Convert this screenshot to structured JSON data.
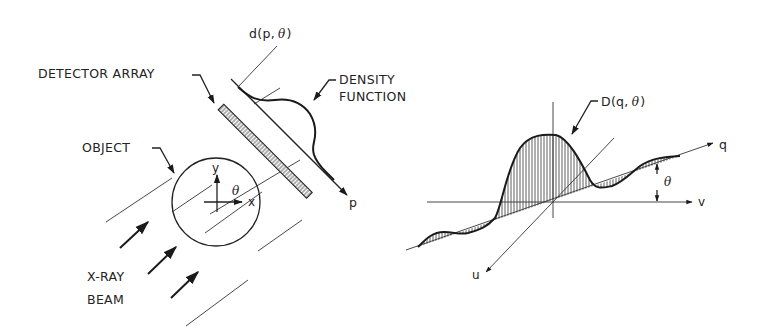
{
  "figure": {
    "left_panel": {
      "title": "CT projection acquisition geometry",
      "labels": {
        "projection": "d(p, θ)",
        "projection_prefix": "d(p,",
        "projection_theta": "θ",
        "projection_suffix": ")",
        "detector_array": "DETECTOR ARRAY",
        "density_function_line1": "DENSITY",
        "density_function_line2": "FUNCTION",
        "object": "OBJECT",
        "x_ray_beam_line1": "X-RAY",
        "x_ray_beam_line2": "BEAM",
        "axis_x": "x",
        "axis_y": "y",
        "axis_p": "p",
        "angle": "θ"
      }
    },
    "right_panel": {
      "title": "Fourier transform of projection",
      "labels": {
        "transform_prefix": "D(q,",
        "transform_theta": "θ",
        "transform_suffix": ")",
        "axis_q": "q",
        "axis_v": "v",
        "axis_u": "u",
        "angle": "θ"
      }
    }
  }
}
